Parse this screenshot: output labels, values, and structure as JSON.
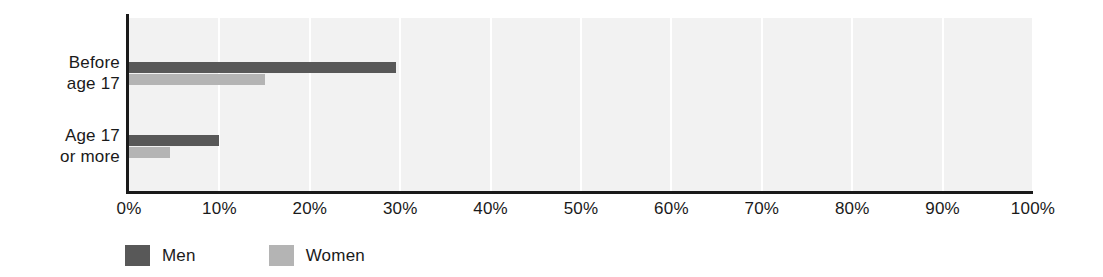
{
  "chart_data": {
    "type": "bar",
    "orientation": "horizontal",
    "title": "",
    "subtitle": "",
    "xlabel": "",
    "ylabel": "",
    "categories": [
      "Before age 17",
      "Age 17 or more"
    ],
    "category_lines": [
      [
        "Before",
        "age 17"
      ],
      [
        "Age 17",
        "or more"
      ]
    ],
    "series": [
      {
        "name": "Men",
        "color": "#585858",
        "values": [
          29.5,
          10.0
        ]
      },
      {
        "name": "Women",
        "color": "#b4b4b4",
        "values": [
          15.0,
          4.5
        ]
      }
    ],
    "xlim": [
      0,
      100
    ],
    "xticks": [
      0,
      10,
      20,
      30,
      40,
      50,
      60,
      70,
      80,
      90,
      100
    ],
    "xtick_labels": [
      "0%",
      "10%",
      "20%",
      "30%",
      "40%",
      "50%",
      "60%",
      "70%",
      "80%",
      "90%",
      "100%"
    ],
    "grid": "vertical",
    "grid_color": "#ffffff",
    "plot_background": "#f2f2f2",
    "axis_color": "#1a1a1a",
    "legend_position": "bottom-left",
    "legend": [
      {
        "label": "Men",
        "color": "#585858"
      },
      {
        "label": "Women",
        "color": "#b4b4b4"
      }
    ]
  }
}
